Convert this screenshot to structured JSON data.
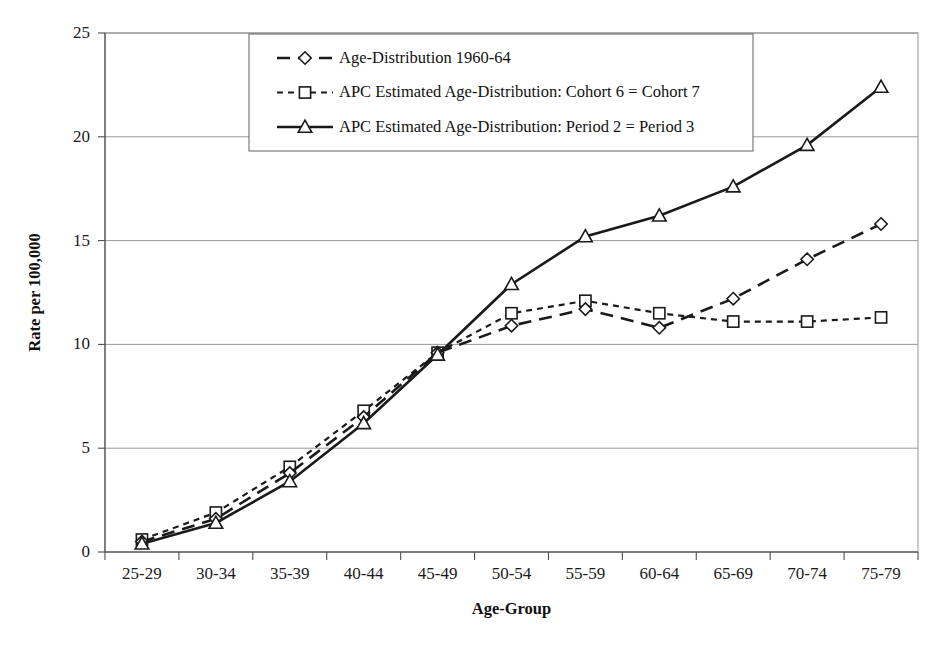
{
  "chart_data": {
    "type": "line",
    "title": "",
    "xlabel": "Age-Group",
    "ylabel": "Rate per 100,000",
    "categories": [
      "25-29",
      "30-34",
      "35-39",
      "40-44",
      "45-49",
      "50-54",
      "55-59",
      "60-64",
      "65-69",
      "70-74",
      "75-79"
    ],
    "ylim": [
      0,
      25
    ],
    "yticks": [
      0,
      5,
      10,
      15,
      20,
      25
    ],
    "grid": "horizontal",
    "legend_position": "top-center",
    "series": [
      {
        "name": "Age-Distribution 1960-64",
        "marker": "diamond",
        "line_style": "long-dash",
        "color": "#1a1a1a",
        "values": [
          0.5,
          1.6,
          3.8,
          6.5,
          9.6,
          10.9,
          11.7,
          10.8,
          12.2,
          14.1,
          15.8
        ]
      },
      {
        "name": "APC Estimated Age-Distribution: Cohort 6 = Cohort 7",
        "marker": "square",
        "line_style": "short-dash",
        "color": "#1a1a1a",
        "values": [
          0.6,
          1.9,
          4.1,
          6.8,
          9.6,
          11.5,
          12.1,
          11.5,
          11.1,
          11.1,
          11.3
        ]
      },
      {
        "name": "APC Estimated Age-Distribution: Period 2 = Period 3",
        "marker": "triangle",
        "line_style": "solid",
        "color": "#1a1a1a",
        "values": [
          0.4,
          1.4,
          3.4,
          6.2,
          9.5,
          12.9,
          15.2,
          16.2,
          17.6,
          19.6,
          22.4
        ]
      }
    ]
  },
  "legend": {
    "entries": [
      "Age-Distribution 1960-64",
      "APC Estimated Age-Distribution: Cohort 6 = Cohort 7",
      "APC Estimated Age-Distribution: Period 2 = Period 3"
    ]
  }
}
